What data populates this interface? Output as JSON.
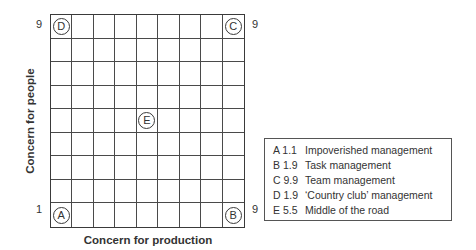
{
  "diagram": {
    "x_axis": {
      "label": "Concern for production",
      "min_label": "1",
      "max_label": "9"
    },
    "y_axis": {
      "label": "Concern for people",
      "min_label": "1",
      "max_label": "9"
    },
    "grid_size": 9,
    "markers": [
      {
        "id": "A",
        "x": 1,
        "y": 1
      },
      {
        "id": "B",
        "x": 9,
        "y": 1
      },
      {
        "id": "C",
        "x": 9,
        "y": 9
      },
      {
        "id": "D",
        "x": 1,
        "y": 9
      },
      {
        "id": "E",
        "x": 5,
        "y": 5
      }
    ],
    "legend": [
      {
        "code": "A 1.1",
        "label": "Impoverished management"
      },
      {
        "code": "B 1.9",
        "label": "Task management"
      },
      {
        "code": "C 9.9",
        "label": "Team management"
      },
      {
        "code": "D 1.9",
        "label": "‘Country club’ management"
      },
      {
        "code": "E 5.5",
        "label": "Middle of the road"
      }
    ]
  }
}
